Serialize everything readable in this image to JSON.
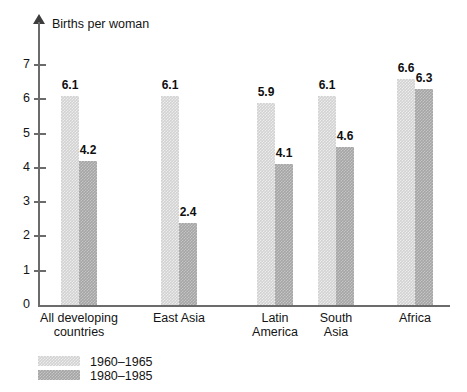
{
  "chart_data": {
    "type": "bar",
    "title": "",
    "ylabel": "Births per woman",
    "xlabel": "",
    "ylim": [
      0,
      7
    ],
    "grid": false,
    "legend_position": "bottom-left",
    "categories": [
      "All developing countries",
      "East Asia",
      "Latin America",
      "South Asia",
      "Africa"
    ],
    "category_lines": [
      [
        "All developing",
        "countries"
      ],
      [
        "East Asia",
        ""
      ],
      [
        "Latin",
        "America"
      ],
      [
        "South",
        "Asia"
      ],
      [
        "Africa",
        ""
      ]
    ],
    "series": [
      {
        "name": "1960–1965",
        "color": "#d2d2d2",
        "values": [
          6.1,
          6.1,
          5.9,
          6.1,
          6.6
        ]
      },
      {
        "name": "1980–1985",
        "color": "#a5a5a5",
        "values": [
          4.2,
          2.4,
          4.1,
          4.6,
          6.3
        ]
      }
    ],
    "ytick_labels": [
      "0",
      "1",
      "2",
      "3",
      "4",
      "5",
      "6",
      "7"
    ],
    "ytick_values": [
      0,
      1,
      2,
      3,
      4,
      5,
      6,
      7
    ],
    "value_labels": [
      [
        "6.1",
        "4.2"
      ],
      [
        "6.1",
        "2.4"
      ],
      [
        "5.9",
        "4.1"
      ],
      [
        "6.1",
        "4.6"
      ],
      [
        "6.6",
        "6.3"
      ]
    ]
  },
  "legend": {
    "items": [
      {
        "label": "1960–1965",
        "color": "#d2d2d2"
      },
      {
        "label": "1980–1985",
        "color": "#a5a5a5"
      }
    ]
  }
}
